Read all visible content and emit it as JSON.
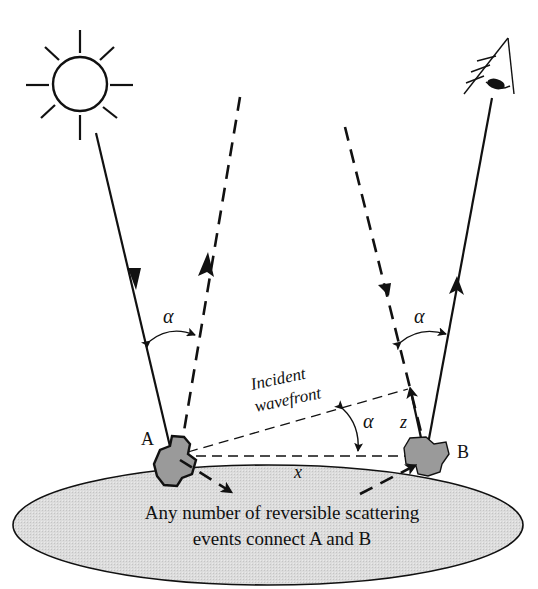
{
  "diagram": {
    "labels": {
      "point_a": "A",
      "point_b": "B",
      "alpha_left": "α",
      "alpha_right": "α",
      "alpha_wavefront": "α",
      "wavefront_line1": "Incident",
      "wavefront_line2": "wavefront",
      "x_label": "x",
      "z_label": "z",
      "medium_text_line1": "Any number of reversible scattering",
      "medium_text_line2": "events connect A and B"
    },
    "icons": {
      "source": "sun-icon",
      "observer": "eye-icon"
    },
    "colors": {
      "stroke": "#111111",
      "medium_fill": "#d9d9d9",
      "scatterer_fill": "#9a9a9a",
      "background": "#ffffff"
    }
  }
}
